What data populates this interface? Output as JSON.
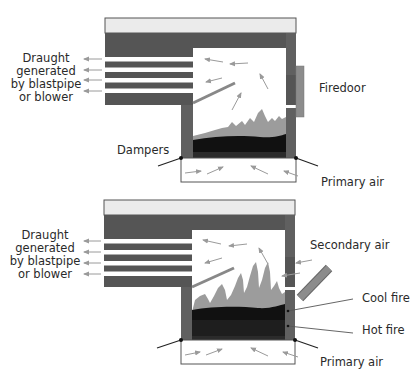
{
  "colors": {
    "boiler_dark": "#555555",
    "boiler_light": "#ebebeb",
    "wall": "#606060",
    "flame": "#9c9c9c",
    "coal_black": "#111111",
    "coal_dark": "#2b2b2b",
    "door": "#8c8c8c",
    "arrow": "#9a9a9a",
    "leader": "#222222"
  },
  "top_diagram": {
    "draught_label": [
      "Draught",
      "generated",
      "by blastpipe",
      "or blower"
    ],
    "firedoor_label": "Firedoor",
    "dampers_label": "Dampers",
    "primary_air_label": "Primary air",
    "state": "firedoor closed"
  },
  "bottom_diagram": {
    "draught_label": [
      "Draught",
      "generated",
      "by blastpipe",
      "or blower"
    ],
    "secondary_air_label": "Secondary air",
    "cool_fire_label": "Cool fire",
    "hot_fire_label": "Hot fire",
    "primary_air_label": "Primary air",
    "state": "firedoor open"
  }
}
